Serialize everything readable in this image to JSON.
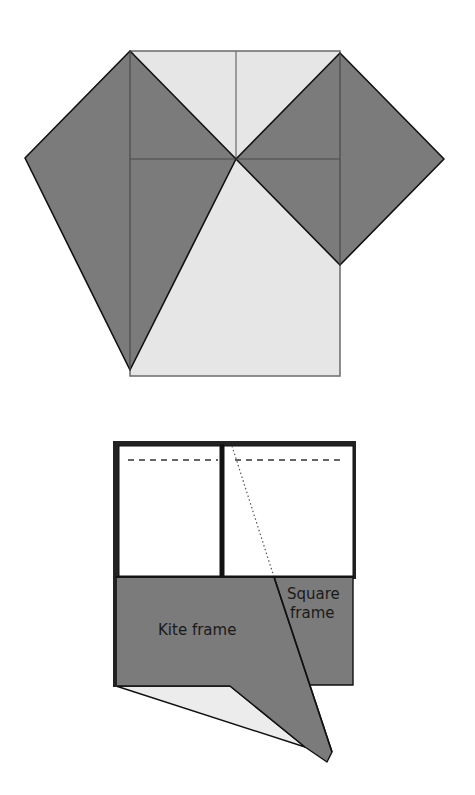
{
  "figure_top": {
    "description": "Square of paper with two corners folded out into dark kite and square shapes",
    "colors": {
      "paper_light": "#e6e6e6",
      "paper_dark": "#7b7b7b",
      "edge": "#111111",
      "crease": "#555555"
    }
  },
  "figure_bottom": {
    "labels": {
      "kite": "Kite frame",
      "square_line1": "Square",
      "square_line2": "frame"
    },
    "colors": {
      "paper_white": "#ffffff",
      "paper_light": "#ececec",
      "paper_dark": "#7b7b7b",
      "edge": "#111111"
    }
  }
}
